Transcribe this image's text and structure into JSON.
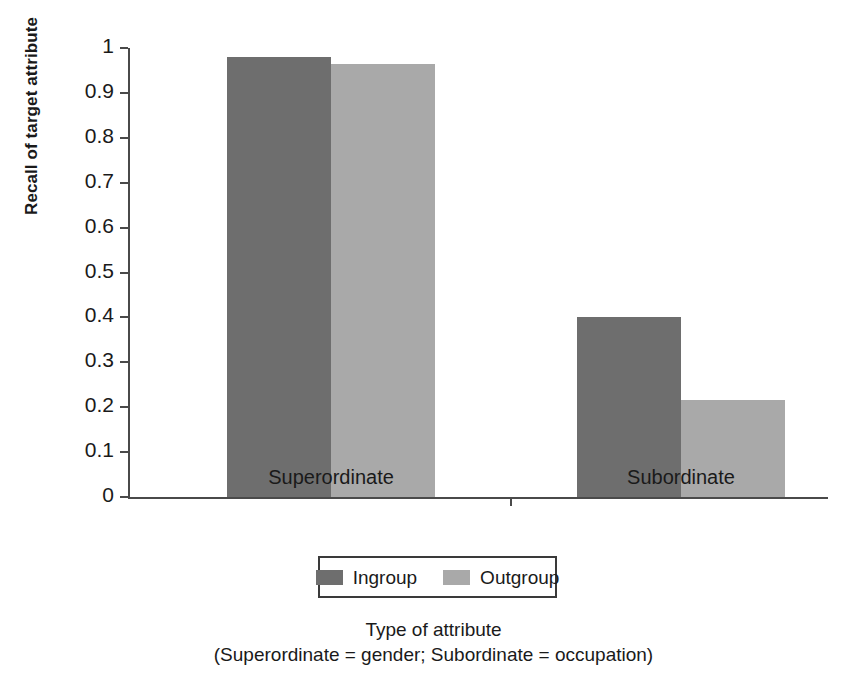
{
  "chart_data": {
    "type": "bar",
    "title": "",
    "subtitle": "",
    "categories": [
      "Superordinate",
      "Subordinate"
    ],
    "series": [
      {
        "name": "Ingroup",
        "color": "#6e6e6e",
        "values": [
          0.98,
          0.4
        ]
      },
      {
        "name": "Outgroup",
        "color": "#a9a9a9",
        "values": [
          0.965,
          0.215
        ]
      }
    ],
    "xlabel": "Type of attribute",
    "xlabel_note": "(Superordinate = gender; Subordinate = occupation)",
    "ylabel": "Recall of target attribute",
    "ylim": [
      0,
      1
    ],
    "ytick_labels": [
      "1",
      "0.9",
      "0.8",
      "0.7",
      "0.6",
      "0.5",
      "0.4",
      "0.3",
      "0.2",
      "0.1",
      "0"
    ],
    "ytick_values": [
      1,
      0.9,
      0.8,
      0.7,
      0.6,
      0.5,
      0.4,
      0.3,
      0.2,
      0.1,
      0
    ],
    "grid": false,
    "legend_position": "bottom"
  },
  "legend": {
    "entries": [
      {
        "label": "Ingroup",
        "color": "#6e6e6e"
      },
      {
        "label": "Outgroup",
        "color": "#a9a9a9"
      }
    ]
  },
  "axes": {
    "y_title": "Recall of target attribute",
    "x_title": "Type of attribute",
    "x_title_note": "(Superordinate = gender; Subordinate = occupation)",
    "category_labels": [
      "Superordinate",
      "Subordinate"
    ]
  }
}
